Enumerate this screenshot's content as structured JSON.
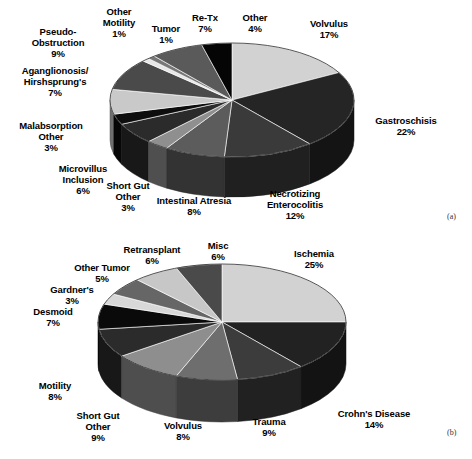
{
  "figure": {
    "panel_a_tag": "(a)",
    "panel_b_tag": "(b)"
  },
  "chart_data": [
    {
      "type": "pie",
      "id": "a",
      "title": "",
      "panel": "(a)",
      "legend": "none",
      "start_angle_deg": -90,
      "direction": "clockwise",
      "categories": [
        "Volvulus",
        "Gastroschisis",
        "Necrotizing Enterocolitis",
        "Intestinal Atresia",
        "Short Gut Other",
        "Microvillus Inclusion",
        "Malabsorption Other",
        "Aganglionosis/ Hirshsprung's",
        "Pseudo-Obstruction",
        "Other Motility",
        "Tumor",
        "Re-Tx",
        "Other"
      ],
      "values": [
        17,
        22,
        12,
        8,
        3,
        6,
        3,
        7,
        9,
        1,
        1,
        7,
        4
      ],
      "labels": [
        "17%",
        "22%",
        "12%",
        "8%",
        "3%",
        "6%",
        "3%",
        "7%",
        "9%",
        "1%",
        "1%",
        "7%",
        "4%"
      ],
      "colors": [
        "#d2d2d2",
        "#252525",
        "#3a3a3a",
        "#5c5c5c",
        "#8f8f8f",
        "#2b2b2b",
        "#0d0d0d",
        "#c9c9c9",
        "#4a4a4a",
        "#e8e8e8",
        "#787878",
        "#5a5a5a",
        "#050505"
      ],
      "units": "percent"
    },
    {
      "type": "pie",
      "id": "b",
      "title": "",
      "panel": "(b)",
      "legend": "none",
      "start_angle_deg": -90,
      "direction": "clockwise",
      "categories": [
        "Ischemia",
        "Crohn's Disease",
        "Trauma",
        "Volvulus",
        "Short Gut Other",
        "Motility",
        "Desmoid",
        "Gardner's",
        "Other Tumor",
        "Retransplant",
        "Misc"
      ],
      "values": [
        25,
        14,
        9,
        8,
        9,
        8,
        7,
        3,
        5,
        6,
        6
      ],
      "labels": [
        "25%",
        "14%",
        "9%",
        "8%",
        "9%",
        "8%",
        "7%",
        "3%",
        "5%",
        "6%",
        "6%"
      ],
      "colors": [
        "#d2d2d2",
        "#222222",
        "#3c3c3c",
        "#6e6e6e",
        "#8e8e8e",
        "#2b2b2b",
        "#0a0a0a",
        "#d8d8d8",
        "#666666",
        "#c7c7c7",
        "#4a4a4a"
      ],
      "units": "percent"
    }
  ],
  "chart_a_labels": [
    {
      "name": "Volvulus",
      "pct": "17%"
    },
    {
      "name": "Gastroschisis",
      "pct": "22%"
    },
    {
      "name": "Necrotizing\nEnterocolitis",
      "pct": "12%"
    },
    {
      "name": "Intestinal Atresia",
      "pct": "8%"
    },
    {
      "name": "Short Gut\nOther",
      "pct": "3%"
    },
    {
      "name": "Microvillus\nInclusion",
      "pct": "6%"
    },
    {
      "name": "Malabsorption\nOther",
      "pct": "3%"
    },
    {
      "name": "Aganglionosis/\nHirshsprung's",
      "pct": "7%"
    },
    {
      "name": "Pseudo-\nObstruction",
      "pct": "9%"
    },
    {
      "name": "Other\nMotility",
      "pct": "1%"
    },
    {
      "name": "Tumor",
      "pct": "1%"
    },
    {
      "name": "Re-Tx",
      "pct": "7%"
    },
    {
      "name": "Other",
      "pct": "4%"
    }
  ],
  "chart_b_labels": [
    {
      "name": "Ischemia",
      "pct": "25%"
    },
    {
      "name": "Crohn's Disease",
      "pct": "14%"
    },
    {
      "name": "Trauma",
      "pct": "9%"
    },
    {
      "name": "Volvulus",
      "pct": "8%"
    },
    {
      "name": "Short Gut\nOther",
      "pct": "9%"
    },
    {
      "name": "Motility",
      "pct": "8%"
    },
    {
      "name": "Desmoid",
      "pct": "7%"
    },
    {
      "name": "Gardner's",
      "pct": "3%"
    },
    {
      "name": "Other Tumor",
      "pct": "5%"
    },
    {
      "name": "Retransplant",
      "pct": "6%"
    },
    {
      "name": "Misc",
      "pct": "6%"
    }
  ],
  "text_a": {
    "volvulus": "Volvulus\n17%",
    "gastroschisis": "Gastroschisis\n22%",
    "nec": "Necrotizing\nEnterocolitis\n12%",
    "atresia": "Intestinal Atresia\n8%",
    "shortgut": "Short Gut\nOther\n3%",
    "microvillus": "Microvillus\nInclusion\n6%",
    "malabsorption": "Malabsorption\nOther\n3%",
    "aganglionosis": "Aganglionosis/\nHirshsprung's\n7%",
    "pseudo": "Pseudo-\nObstruction\n9%",
    "othermotility": "Other\nMotility\n1%",
    "tumor": "Tumor\n1%",
    "retx": "Re-Tx\n7%",
    "other": "Other\n4%"
  },
  "text_b": {
    "ischemia": "Ischemia\n25%",
    "crohns": "Crohn's Disease\n14%",
    "trauma": "Trauma\n9%",
    "volvulus": "Volvulus\n8%",
    "shortgut": "Short Gut\nOther\n9%",
    "motility": "Motility\n8%",
    "desmoid": "Desmoid\n7%",
    "gardners": "Gardner's\n3%",
    "othertumor": "Other Tumor\n5%",
    "retransplant": "Retransplant\n6%",
    "misc": "Misc\n6%"
  }
}
